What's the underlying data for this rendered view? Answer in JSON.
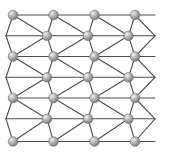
{
  "figure": {
    "background_color": "#ffffff",
    "width": 170,
    "height": 160
  },
  "style": {
    "atom_fill_light": "#e8e8e8",
    "atom_fill_mid": "#b0b0b0",
    "atom_fill_dark": "#7d7d7d",
    "atom_stroke": "#6b6b6b",
    "bond_color": "#4c4c4c",
    "bond_width": 1.1,
    "atom_radius": 4.8
  },
  "lattice": {
    "type": "zigzag-2d",
    "main_row_y": [
      15,
      56.5,
      98,
      141.5
    ],
    "offset_row_y": [
      35.8,
      77.3,
      118.8
    ],
    "main_row_x": [
      13,
      53.5,
      94.5,
      135
    ],
    "offset_row_x": [
      47,
      88,
      128.5
    ],
    "edge_vertex_left_x": 6,
    "edge_vertex_right_x": 155,
    "row_count": 7,
    "atom_count": 37
  },
  "atoms": [
    {
      "id": "a-r0-c0",
      "x": 13,
      "y": 15,
      "row": 0,
      "col": 0
    },
    {
      "id": "a-r0-c1",
      "x": 53.5,
      "y": 15,
      "row": 0,
      "col": 1
    },
    {
      "id": "a-r0-c2",
      "x": 94.5,
      "y": 15,
      "row": 0,
      "col": 2
    },
    {
      "id": "a-r0-c3",
      "x": 135,
      "y": 15,
      "row": 0,
      "col": 3
    },
    {
      "id": "a-r1-c0",
      "x": 47,
      "y": 35.8,
      "row": 1,
      "col": 0
    },
    {
      "id": "a-r1-c1",
      "x": 88,
      "y": 35.8,
      "row": 1,
      "col": 1
    },
    {
      "id": "a-r1-c2",
      "x": 128.5,
      "y": 35.8,
      "row": 1,
      "col": 2
    },
    {
      "id": "a-r2-c0",
      "x": 13,
      "y": 56.5,
      "row": 2,
      "col": 0
    },
    {
      "id": "a-r2-c1",
      "x": 53.5,
      "y": 56.5,
      "row": 2,
      "col": 1
    },
    {
      "id": "a-r2-c2",
      "x": 94.5,
      "y": 56.5,
      "row": 2,
      "col": 2
    },
    {
      "id": "a-r2-c3",
      "x": 135,
      "y": 56.5,
      "row": 2,
      "col": 3
    },
    {
      "id": "a-r3-c0",
      "x": 47,
      "y": 77.3,
      "row": 3,
      "col": 0
    },
    {
      "id": "a-r3-c1",
      "x": 88,
      "y": 77.3,
      "row": 3,
      "col": 1
    },
    {
      "id": "a-r3-c2",
      "x": 128.5,
      "y": 77.3,
      "row": 3,
      "col": 2
    },
    {
      "id": "a-r4-c0",
      "x": 13,
      "y": 98,
      "row": 4,
      "col": 0
    },
    {
      "id": "a-r4-c1",
      "x": 53.5,
      "y": 98,
      "row": 4,
      "col": 1
    },
    {
      "id": "a-r4-c2",
      "x": 94.5,
      "y": 98,
      "row": 4,
      "col": 2
    },
    {
      "id": "a-r4-c3",
      "x": 135,
      "y": 98,
      "row": 4,
      "col": 3
    },
    {
      "id": "a-r5-c0",
      "x": 47,
      "y": 118.8,
      "row": 5,
      "col": 0
    },
    {
      "id": "a-r5-c1",
      "x": 88,
      "y": 118.8,
      "row": 5,
      "col": 1
    },
    {
      "id": "a-r5-c2",
      "x": 128.5,
      "y": 118.8,
      "row": 5,
      "col": 2
    },
    {
      "id": "a-r6-c0",
      "x": 13,
      "y": 141.5,
      "row": 6,
      "col": 0
    },
    {
      "id": "a-r6-c1",
      "x": 53.5,
      "y": 141.5,
      "row": 6,
      "col": 1
    },
    {
      "id": "a-r6-c2",
      "x": 94.5,
      "y": 141.5,
      "row": 6,
      "col": 2
    },
    {
      "id": "a-r6-c3",
      "x": 135,
      "y": 141.5,
      "row": 6,
      "col": 3
    }
  ],
  "bonds": {
    "horizontal_rows": [
      {
        "row": 0,
        "y": 15,
        "x1": 13,
        "x2": 155
      },
      {
        "row": 1,
        "y": 35.8,
        "x1": 6,
        "x2": 155
      },
      {
        "row": 2,
        "y": 56.5,
        "x1": 13,
        "x2": 155
      },
      {
        "row": 3,
        "y": 77.3,
        "x1": 6,
        "x2": 155
      },
      {
        "row": 4,
        "y": 98,
        "x1": 13,
        "x2": 155
      },
      {
        "row": 5,
        "y": 118.8,
        "x1": 6,
        "x2": 155
      },
      {
        "row": 6,
        "y": 141.5,
        "x1": 13,
        "x2": 155
      }
    ],
    "diagonal_description": "Chevron zigzag bonds linking each main-row atom down-right to the offset row, then down-left back to the next main row"
  }
}
